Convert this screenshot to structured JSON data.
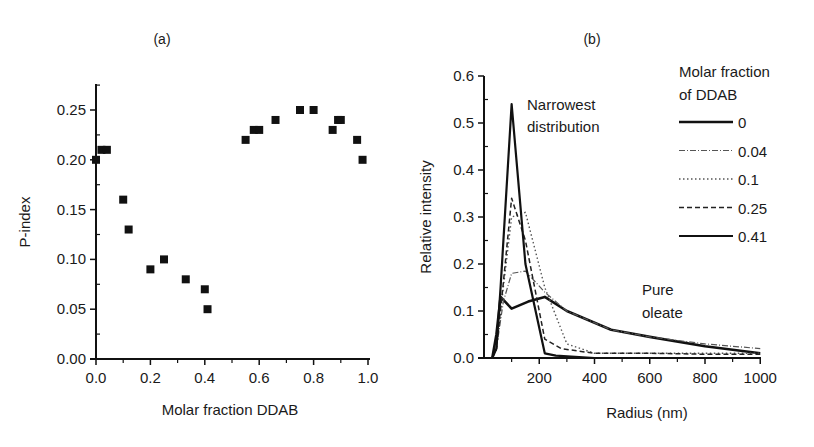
{
  "chart_data": [
    {
      "panel": "(a)",
      "type": "scatter",
      "title": "(a)",
      "xlabel": "Molar fraction DDAB",
      "ylabel": "P-index",
      "xlim": [
        0,
        1.0
      ],
      "ylim": [
        0,
        0.275
      ],
      "xticks": [
        "0.0",
        "0.2",
        "0.4",
        "0.6",
        "0.8",
        "1.0"
      ],
      "yticks": [
        "0.00",
        "0.05",
        "0.10",
        "0.15",
        "0.20",
        "0.25"
      ],
      "grid": false,
      "x": [
        0.0,
        0.02,
        0.04,
        0.1,
        0.12,
        0.2,
        0.25,
        0.33,
        0.4,
        0.41,
        0.55,
        0.58,
        0.6,
        0.66,
        0.75,
        0.8,
        0.87,
        0.89,
        0.9,
        0.96,
        0.98
      ],
      "y": [
        0.2,
        0.21,
        0.21,
        0.16,
        0.13,
        0.09,
        0.1,
        0.08,
        0.07,
        0.05,
        0.22,
        0.23,
        0.23,
        0.24,
        0.25,
        0.25,
        0.23,
        0.24,
        0.24,
        0.22,
        0.2
      ]
    },
    {
      "panel": "(b)",
      "type": "line",
      "title": "(b)",
      "xlabel": "Radius (nm)",
      "ylabel": "Relative intensity",
      "xlim": [
        0,
        1000
      ],
      "ylim": [
        0,
        0.6
      ],
      "xticks": [
        "200",
        "400",
        "600",
        "800",
        "1000"
      ],
      "yticks": [
        "0.0",
        "0.1",
        "0.2",
        "0.3",
        "0.4",
        "0.5",
        "0.6"
      ],
      "grid": false,
      "legend_title": "Molar fraction of DDAB",
      "legend_position": "upper right",
      "annotations": [
        {
          "text": "Narrowest distribution",
          "near": [
            100,
            0.54
          ]
        },
        {
          "text": "Pure oleate",
          "near": [
            600,
            0.12
          ]
        }
      ],
      "series": [
        {
          "name": "0",
          "style": "solid-thick",
          "x": [
            30,
            45,
            60,
            100,
            160,
            220,
            300,
            460,
            600,
            800,
            1000
          ],
          "y": [
            0.0,
            0.05,
            0.13,
            0.105,
            0.12,
            0.13,
            0.1,
            0.06,
            0.045,
            0.025,
            0.01
          ]
        },
        {
          "name": "0.04",
          "style": "dash-dot",
          "x": [
            30,
            45,
            70,
            100,
            150,
            220,
            300,
            460,
            600,
            800,
            1000
          ],
          "y": [
            0.0,
            0.02,
            0.12,
            0.18,
            0.185,
            0.14,
            0.1,
            0.06,
            0.045,
            0.03,
            0.02
          ]
        },
        {
          "name": "0.1",
          "style": "dotted",
          "x": [
            30,
            45,
            70,
            100,
            150,
            220,
            300,
            400,
            600,
            800,
            1000
          ],
          "y": [
            0.0,
            0.02,
            0.15,
            0.3,
            0.31,
            0.15,
            0.03,
            0.01,
            0.01,
            0.01,
            0.01
          ]
        },
        {
          "name": "0.25",
          "style": "dashed",
          "x": [
            30,
            45,
            70,
            100,
            150,
            220,
            280,
            400,
            600,
            800,
            1000
          ],
          "y": [
            0.0,
            0.02,
            0.16,
            0.34,
            0.25,
            0.04,
            0.02,
            0.01,
            0.01,
            0.008,
            0.008
          ]
        },
        {
          "name": "0.41",
          "style": "solid",
          "x": [
            30,
            45,
            60,
            100,
            150,
            220,
            260,
            400,
            600,
            800,
            1000
          ],
          "y": [
            0.0,
            0.02,
            0.15,
            0.54,
            0.2,
            0.01,
            0.005,
            0.0,
            0.0,
            0.0,
            0.0
          ]
        }
      ]
    }
  ]
}
